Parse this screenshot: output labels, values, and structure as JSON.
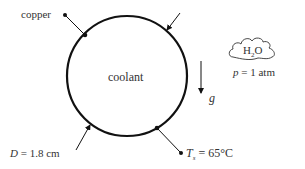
{
  "diagram": {
    "tube_label": "coolant",
    "wall_label": "copper",
    "diameter": {
      "symbol": "D",
      "value": "= 1.8 cm"
    },
    "surface_temp": {
      "symbol": "T",
      "subscript": "s",
      "value": "= 65°C"
    },
    "gravity": {
      "symbol": "g"
    },
    "environment": {
      "fluid": "H",
      "fluid_sub": "2",
      "fluid_rest": "O",
      "pressure_symbol": "p",
      "pressure_value": "= 1 atm"
    }
  },
  "colors": {
    "stroke": "#111111",
    "text": "#333333"
  }
}
